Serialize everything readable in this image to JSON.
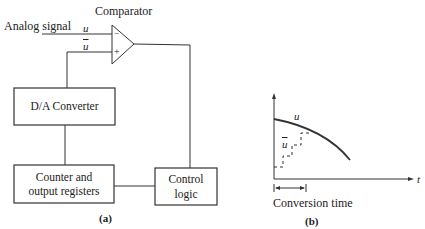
{
  "diagram_a": {
    "comparator_label": "Comparator",
    "input_label": "Analog signal",
    "u_label": "u",
    "u_bar_label": "u",
    "minus_sign": "−",
    "plus_sign": "+",
    "da_converter_label": "D/A Converter",
    "counter_label_line1": "Counter and",
    "counter_label_line2": "output registers",
    "control_label_line1": "Control",
    "control_label_line2": "logic",
    "caption": "(a)"
  },
  "diagram_b": {
    "curve_label": "u",
    "staircase_label": "u",
    "t_axis_label": "t",
    "conversion_time_label": "Conversion time",
    "caption": "(b)"
  },
  "colors": {
    "line": "#333333",
    "text": "#222222",
    "background": "#ffffff"
  }
}
